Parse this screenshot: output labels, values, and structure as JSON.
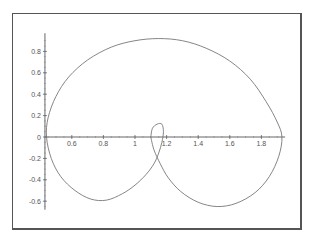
{
  "chart_data": {
    "type": "line",
    "title": "",
    "xlabel": "",
    "ylabel": "",
    "xlim": [
      0.43,
      1.95
    ],
    "ylim": [
      -0.68,
      0.97
    ],
    "grid": false,
    "x_ticks": [
      {
        "value": 0.6,
        "label": "0.6"
      },
      {
        "value": 0.8,
        "label": "0.8"
      },
      {
        "value": 1.0,
        "label": "1"
      },
      {
        "value": 1.2,
        "label": "1.2"
      },
      {
        "value": 1.4,
        "label": "1.4"
      },
      {
        "value": 1.6,
        "label": "1.6"
      },
      {
        "value": 1.8,
        "label": "1.8"
      }
    ],
    "y_ticks": [
      {
        "value": 0.8,
        "label": "0.8"
      },
      {
        "value": 0.6,
        "label": "0.6"
      },
      {
        "value": 0.4,
        "label": "0.4"
      },
      {
        "value": 0.2,
        "label": "0.2"
      },
      {
        "value": 0,
        "label": "0"
      },
      {
        "value": -0.2,
        "label": "-0.2"
      },
      {
        "value": -0.4,
        "label": "-0.4"
      },
      {
        "value": -0.6,
        "label": "-0.6"
      }
    ],
    "series": [
      {
        "name": "curve",
        "color": "#777777",
        "points": [
          [
            1.1,
            0.0
          ],
          [
            1.11,
            0.08
          ],
          [
            1.14,
            0.12
          ],
          [
            1.17,
            0.12
          ],
          [
            1.18,
            0.05
          ],
          [
            1.17,
            -0.05
          ],
          [
            1.15,
            -0.15
          ],
          [
            1.12,
            -0.25
          ],
          [
            1.07,
            -0.35
          ],
          [
            1.0,
            -0.45
          ],
          [
            0.92,
            -0.53
          ],
          [
            0.82,
            -0.59
          ],
          [
            0.72,
            -0.58
          ],
          [
            0.62,
            -0.5
          ],
          [
            0.53,
            -0.37
          ],
          [
            0.47,
            -0.2
          ],
          [
            0.44,
            0.0
          ],
          [
            0.45,
            0.18
          ],
          [
            0.5,
            0.38
          ],
          [
            0.58,
            0.56
          ],
          [
            0.7,
            0.72
          ],
          [
            0.85,
            0.84
          ],
          [
            1.0,
            0.9
          ],
          [
            1.15,
            0.92
          ],
          [
            1.3,
            0.9
          ],
          [
            1.45,
            0.83
          ],
          [
            1.6,
            0.71
          ],
          [
            1.73,
            0.54
          ],
          [
            1.83,
            0.33
          ],
          [
            1.9,
            0.14
          ],
          [
            1.93,
            0.0
          ],
          [
            1.91,
            -0.18
          ],
          [
            1.85,
            -0.37
          ],
          [
            1.76,
            -0.52
          ],
          [
            1.64,
            -0.62
          ],
          [
            1.52,
            -0.65
          ],
          [
            1.4,
            -0.61
          ],
          [
            1.29,
            -0.51
          ],
          [
            1.21,
            -0.38
          ],
          [
            1.16,
            -0.25
          ],
          [
            1.12,
            -0.12
          ],
          [
            1.1,
            0.0
          ]
        ]
      }
    ]
  }
}
